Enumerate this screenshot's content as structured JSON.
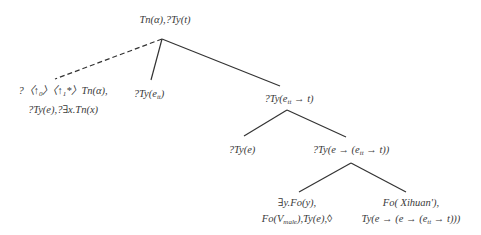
{
  "diagram": {
    "type": "tree",
    "nodes": [
      {
        "id": "root",
        "lines": [
          "Tn(α),?Ty(t)"
        ]
      },
      {
        "id": "unfixed",
        "lines": [
          "?〈↑₀〉〈↑₁*〉Tn(α),",
          "?Ty(e),?∃x.Tn(x)"
        ]
      },
      {
        "id": "subject",
        "lines": [
          "?Ty(e_tt)"
        ]
      },
      {
        "id": "predicate",
        "lines": [
          "?Ty(e_tt → t)"
        ]
      },
      {
        "id": "object",
        "lines": [
          "?Ty(e)"
        ]
      },
      {
        "id": "transitive",
        "lines": [
          "?Ty(e → (e_tt → t))"
        ]
      },
      {
        "id": "metavariable",
        "lines": [
          "∃y.Fo(y),",
          "Fo(V_male),Ty(e),◊"
        ]
      },
      {
        "id": "verb",
        "lines": [
          "Fo( Xihuan'),",
          "Ty(e → (e → (e_tt → t)))"
        ]
      }
    ],
    "edges": [
      {
        "from": "root",
        "to": "unfixed",
        "style": "dashed"
      },
      {
        "from": "root",
        "to": "subject",
        "style": "solid"
      },
      {
        "from": "root",
        "to": "predicate",
        "style": "solid"
      },
      {
        "from": "predicate",
        "to": "object",
        "style": "solid"
      },
      {
        "from": "predicate",
        "to": "transitive",
        "style": "solid"
      },
      {
        "from": "transitive",
        "to": "metavariable",
        "style": "solid"
      },
      {
        "from": "transitive",
        "to": "verb",
        "style": "solid"
      }
    ]
  },
  "labels": {
    "root": "Tn(α),?Ty(t)",
    "unfixed_l1_a": "?〈↑",
    "unfixed_l1_sub0": "0",
    "unfixed_l1_b": "〉〈↑",
    "unfixed_l1_sub1": "1",
    "unfixed_l1_c": "*〉Tn(α),",
    "unfixed_l2": "?Ty(e),?∃x.Tn(x)",
    "subject_a": "?Ty(e",
    "subject_sub": "tt",
    "subject_b": ")",
    "predicate_a": "?Ty(e",
    "predicate_sub": "tt",
    "predicate_b": " → t)",
    "object": "?Ty(e)",
    "transitive_a": "?Ty(e → (e",
    "transitive_sub": "tt",
    "transitive_b": " → t))",
    "metavariable_l1": "∃y.Fo(y),",
    "metavariable_l2_a": "Fo(V",
    "metavariable_l2_sub": "male",
    "metavariable_l2_b": "),Ty(e),◊",
    "verb_l1": "Fo( Xihuan'),",
    "verb_l2_a": "Ty(e → (e → (e",
    "verb_l2_sub": "tt",
    "verb_l2_b": " → t)))"
  },
  "colors": {
    "edge": "#333333",
    "text": "#3a3a3a",
    "background": "#ffffff"
  }
}
